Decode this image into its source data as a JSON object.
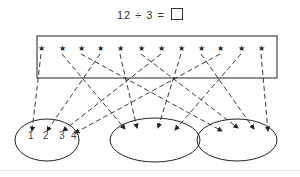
{
  "equation": {
    "text": "12 ÷ 3 = ",
    "blank_symbol": "empty-box"
  },
  "items": {
    "count": 12,
    "symbol": "★",
    "x_positions": [
      41,
      62,
      81,
      100,
      120,
      141,
      161,
      181,
      201,
      220,
      241,
      261
    ],
    "y": 48
  },
  "groups": [
    {
      "label": "group-1",
      "cx": 47,
      "cy": 140,
      "rx": 32,
      "ry": 21,
      "numbers": [
        "1",
        "2",
        "3",
        "4"
      ]
    },
    {
      "label": "group-2",
      "cx": 155,
      "cy": 140,
      "rx": 45,
      "ry": 22,
      "numbers": []
    },
    {
      "label": "group-3",
      "cx": 237,
      "cy": 140,
      "rx": 40,
      "ry": 21,
      "numbers": []
    }
  ],
  "arrows": [
    {
      "from": 0,
      "to": [
        32,
        131
      ]
    },
    {
      "from": 1,
      "to": [
        125,
        129
      ]
    },
    {
      "from": 2,
      "to": [
        222,
        131
      ]
    },
    {
      "from": 3,
      "to": [
        47,
        131
      ]
    },
    {
      "from": 4,
      "to": [
        137,
        128
      ]
    },
    {
      "from": 5,
      "to": [
        238,
        128
      ]
    },
    {
      "from": 6,
      "to": [
        63,
        131
      ]
    },
    {
      "from": 7,
      "to": [
        158,
        128
      ]
    },
    {
      "from": 8,
      "to": [
        254,
        129
      ]
    },
    {
      "from": 9,
      "to": [
        75,
        133
      ]
    },
    {
      "from": 10,
      "to": [
        175,
        130
      ]
    },
    {
      "from": 11,
      "to": [
        268,
        131
      ]
    }
  ],
  "colors": {
    "stroke": "#222222",
    "text": "#444444"
  }
}
